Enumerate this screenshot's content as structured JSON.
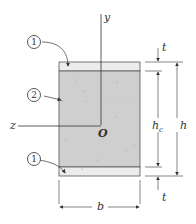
{
  "diagram": {
    "type": "sandwich beam cross-section",
    "axes": {
      "y": "y",
      "z": "z",
      "origin": "O"
    },
    "materials": [
      {
        "id": "1",
        "label": "1",
        "description": "face sheets (top and bottom)"
      },
      {
        "id": "2",
        "label": "2",
        "description": "core"
      }
    ],
    "dimensions": {
      "face_thickness": "t",
      "core_height": "h",
      "core_height_sub": "c",
      "total_height": "h",
      "width": "b"
    },
    "colors": {
      "face": "#ececec",
      "core": "#cfcfcf",
      "outline": "#555555"
    }
  }
}
